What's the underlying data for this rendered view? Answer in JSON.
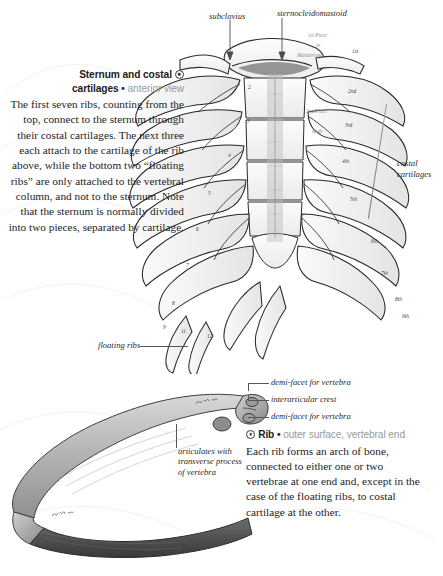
{
  "page": {
    "background": "#ffffff",
    "ink": "#1e1e1e",
    "muted": "#9a9a9a"
  },
  "sternum_section": {
    "title_line1": "Sternum and costal",
    "title_line2": "cartilages",
    "separator": "•",
    "subtitle": "anterior view",
    "body": "The first seven ribs, counting from the top, connect to the sternum through their costal cartilages. The next three each attach to the cartilage of the rib above, while the bottom two “floating ribs” are only attached to the vertebral column, and not to the sternum. Note that the sternum is normally divided into two pieces, separated by cartilage."
  },
  "rib_section": {
    "title": "Rib",
    "separator": "•",
    "subtitle": "outer surface, vertebral end",
    "body": "Each rib forms an arch of bone, connected to either one or two vertebrae at one end and, except in the case of the floating ribs, to costal cartilage at the other."
  },
  "callouts": {
    "subclavius": "subclavius",
    "sternocleidomastoid": "sternocleidomastoid",
    "costal_cartilages_line1": "costal",
    "costal_cartilages_line2": "cartilages",
    "floating_ribs": "floating ribs",
    "demi_facet_upper": "demi-facet for vertebra",
    "interarticular_crest": "interarticular crest",
    "demi_facet_lower": "demi-facet for vertebra",
    "articulates": "articulates with transverse process of vertebra"
  },
  "plate_numbers": {
    "ribcage_left": [
      "2",
      "3",
      "4",
      "5",
      "6",
      "7",
      "8",
      "9"
    ],
    "ribcage_right": [
      "1st",
      "2nd",
      "3rd",
      "4th",
      "5th",
      "6th",
      "7th",
      "8th",
      "9th"
    ],
    "floating": [
      "11",
      "12"
    ]
  },
  "engraved_labels": {
    "first_piece": "1st Piece",
    "or": "or",
    "manubrium": "Manubrium",
    "second_piece": "2nd Piece",
    "body": "Body"
  }
}
